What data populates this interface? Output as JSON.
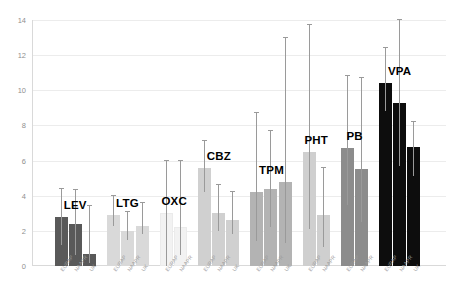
{
  "chart_data": {
    "type": "bar",
    "title": "",
    "subtitle": "",
    "xlabel": "",
    "ylabel": "",
    "ylim": [
      0,
      14
    ],
    "yticks": [
      0,
      2,
      4,
      6,
      8,
      10,
      12,
      14
    ],
    "grid": true,
    "legend_position": "none",
    "categories": [
      "EURAP",
      "NAAPR",
      "UK"
    ],
    "groups": [
      {
        "name": "LEV",
        "color": "#595959",
        "bars": [
          {
            "category": "EURAP",
            "value": 2.8,
            "err_low": 1.2,
            "err_high": 4.4
          },
          {
            "category": "NAAPR",
            "value": 2.4,
            "err_low": 0.6,
            "err_high": 4.3
          },
          {
            "category": "UK",
            "value": 0.7,
            "err_low": 0.2,
            "err_high": 3.4
          }
        ]
      },
      {
        "name": "LTG",
        "color": "#d9d9d9",
        "bars": [
          {
            "category": "EURAP",
            "value": 2.9,
            "err_low": 2.3,
            "err_high": 4.0
          },
          {
            "category": "NAAPR",
            "value": 2.0,
            "err_low": 1.5,
            "err_high": 3.1
          },
          {
            "category": "UK",
            "value": 2.3,
            "err_low": 1.8,
            "err_high": 3.6
          }
        ]
      },
      {
        "name": "OXC",
        "color": "#f2f2f2",
        "bars": [
          {
            "category": "EURAP",
            "value": 3.0,
            "err_low": 0.0,
            "err_high": 6.0
          },
          {
            "category": "NAAPR",
            "value": 2.2,
            "err_low": 0.6,
            "err_high": 6.0
          }
        ]
      },
      {
        "name": "CBZ",
        "color": "#d0d0d0",
        "bars": [
          {
            "category": "EURAP",
            "value": 5.6,
            "err_low": 4.2,
            "err_high": 7.1
          },
          {
            "category": "NAAPR",
            "value": 3.0,
            "err_low": 2.0,
            "err_high": 4.6
          },
          {
            "category": "UK",
            "value": 2.6,
            "err_low": 1.8,
            "err_high": 4.2
          }
        ]
      },
      {
        "name": "TPM",
        "color": "#b3b3b3",
        "bars": [
          {
            "category": "EURAP",
            "value": 4.2,
            "err_low": 1.4,
            "err_high": 8.7
          },
          {
            "category": "NAAPR",
            "value": 4.4,
            "err_low": 2.2,
            "err_high": 7.7
          },
          {
            "category": "UK",
            "value": 4.8,
            "err_low": 1.3,
            "err_high": 13.0
          }
        ]
      },
      {
        "name": "PHT",
        "color": "#cfcfcf",
        "bars": [
          {
            "category": "EURAP",
            "value": 6.5,
            "err_low": 2.1,
            "err_high": 13.7
          },
          {
            "category": "NAAPR",
            "value": 2.9,
            "err_low": 1.1,
            "err_high": 5.6
          }
        ]
      },
      {
        "name": "PB",
        "color": "#8c8c8c",
        "bars": [
          {
            "category": "EURAP",
            "value": 6.7,
            "err_low": 3.5,
            "err_high": 10.8
          },
          {
            "category": "NAAPR",
            "value": 5.5,
            "err_low": 2.5,
            "err_high": 10.7
          }
        ]
      },
      {
        "name": "VPA",
        "color": "#0d0d0d",
        "bars": [
          {
            "category": "EURAP",
            "value": 10.4,
            "err_low": 8.8,
            "err_high": 12.4
          },
          {
            "category": "NAAPR",
            "value": 9.3,
            "err_low": 5.7,
            "err_high": 14.0
          },
          {
            "category": "UK",
            "value": 6.8,
            "err_low": 5.1,
            "err_high": 8.2
          }
        ]
      }
    ]
  }
}
